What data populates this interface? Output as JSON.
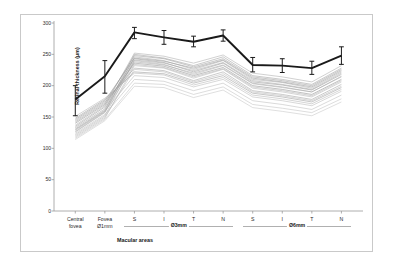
{
  "chart_data": {
    "type": "line",
    "title": "",
    "xlabel": "Macular areas",
    "ylabel": "Retinal thickness (µm)",
    "ylim": [
      0,
      300
    ],
    "yticks": [
      0,
      50,
      100,
      150,
      200,
      250,
      300
    ],
    "grid": false,
    "legend_position": "none",
    "categories": [
      "Central fovea",
      "Fovea Ø1mm",
      "S",
      "I",
      "T",
      "N",
      "S",
      "I",
      "T",
      "N"
    ],
    "category_lines": [
      [
        "Central",
        "fovea"
      ],
      [
        "Fovea",
        "Ø1mm"
      ],
      [
        "S",
        ""
      ],
      [
        "I",
        ""
      ],
      [
        "T",
        ""
      ],
      [
        "N",
        ""
      ],
      [
        "S",
        ""
      ],
      [
        "I",
        ""
      ],
      [
        "T",
        ""
      ],
      [
        "N",
        ""
      ]
    ],
    "groups": [
      {
        "label": "Ø3mm",
        "from_index": 2,
        "to_index": 5
      },
      {
        "label": "Ø6mm",
        "from_index": 6,
        "to_index": 9
      }
    ],
    "series": [
      {
        "name": "Mean retinal thickness",
        "style": "bold-black-with-error-bars",
        "color": "#1a1a1a",
        "values": [
          178,
          215,
          285,
          277,
          270,
          280,
          233,
          232,
          228,
          248
        ],
        "error_low": [
          152,
          188,
          275,
          266,
          262,
          271,
          222,
          221,
          218,
          234
        ],
        "error_high": [
          200,
          240,
          293,
          288,
          279,
          289,
          245,
          243,
          239,
          262
        ]
      },
      {
        "name": "individual-1",
        "style": "thin-grey",
        "color": "#b4b4b4",
        "values": [
          118,
          148,
          232,
          228,
          212,
          226,
          196,
          190,
          182,
          206
        ]
      },
      {
        "name": "individual-2",
        "style": "thin-grey",
        "color": "#b0b0b0",
        "values": [
          122,
          152,
          240,
          234,
          218,
          232,
          203,
          197,
          190,
          214
        ]
      },
      {
        "name": "individual-3",
        "style": "thin-grey",
        "color": "#a8a8a8",
        "values": [
          126,
          157,
          246,
          240,
          226,
          240,
          210,
          205,
          196,
          222
        ]
      },
      {
        "name": "individual-4",
        "style": "thin-grey",
        "color": "#9e9e9e",
        "values": [
          131,
          161,
          250,
          244,
          232,
          246,
          216,
          210,
          202,
          228
        ]
      },
      {
        "name": "individual-5",
        "style": "thin-grey",
        "color": "#969696",
        "values": [
          135,
          166,
          243,
          237,
          222,
          236,
          206,
          201,
          193,
          218
        ]
      },
      {
        "name": "individual-6",
        "style": "thin-grey",
        "color": "#8e8e8e",
        "values": [
          140,
          170,
          236,
          231,
          216,
          229,
          200,
          194,
          186,
          210
        ]
      },
      {
        "name": "individual-7",
        "style": "thin-grey",
        "color": "#a0a0a0",
        "values": [
          144,
          174,
          228,
          224,
          208,
          222,
          192,
          186,
          178,
          202
        ]
      },
      {
        "name": "individual-8",
        "style": "thin-grey",
        "color": "#989898",
        "values": [
          148,
          178,
          222,
          219,
          204,
          216,
          188,
          182,
          174,
          197
        ]
      },
      {
        "name": "individual-9",
        "style": "thin-grey",
        "color": "#b8b8b8",
        "values": [
          130,
          160,
          216,
          213,
          198,
          210,
          182,
          176,
          168,
          191
        ]
      },
      {
        "name": "individual-10",
        "style": "thin-grey",
        "color": "#bcbcbc",
        "values": [
          124,
          154,
          210,
          207,
          192,
          204,
          176,
          170,
          162,
          185
        ]
      },
      {
        "name": "individual-11",
        "style": "thin-grey",
        "color": "#aaaaaa",
        "values": [
          137,
          168,
          252,
          247,
          236,
          249,
          220,
          214,
          206,
          232
        ]
      },
      {
        "name": "individual-12",
        "style": "thin-grey",
        "color": "#9a9a9a",
        "values": [
          142,
          172,
          248,
          243,
          230,
          243,
          214,
          208,
          200,
          226
        ]
      },
      {
        "name": "individual-13",
        "style": "thin-grey",
        "color": "#c0c0c0",
        "values": [
          116,
          146,
          204,
          202,
          186,
          198,
          170,
          164,
          157,
          179
        ]
      },
      {
        "name": "individual-14",
        "style": "thin-grey",
        "color": "#b6b6b6",
        "values": [
          120,
          150,
          226,
          222,
          206,
          219,
          190,
          184,
          176,
          199
        ]
      },
      {
        "name": "individual-15",
        "style": "thin-grey",
        "color": "#a4a4a4",
        "values": [
          133,
          163,
          238,
          233,
          220,
          233,
          204,
          198,
          190,
          215
        ]
      },
      {
        "name": "individual-16",
        "style": "thin-grey",
        "color": "#acacac",
        "values": [
          127,
          158,
          234,
          229,
          214,
          227,
          198,
          192,
          184,
          208
        ]
      },
      {
        "name": "individual-17",
        "style": "thin-grey",
        "color": "#929292",
        "values": [
          146,
          176,
          244,
          239,
          228,
          241,
          212,
          206,
          198,
          224
        ]
      },
      {
        "name": "individual-18",
        "style": "thin-grey",
        "color": "#c4c4c4",
        "values": [
          114,
          144,
          199,
          197,
          181,
          193,
          165,
          159,
          152,
          174
        ]
      },
      {
        "name": "individual-19",
        "style": "thin-grey",
        "color": "#b2b2b2",
        "values": [
          151,
          180,
          220,
          217,
          201,
          213,
          185,
          179,
          171,
          194
        ]
      },
      {
        "name": "individual-20",
        "style": "thin-grey",
        "color": "#a6a6a6",
        "values": [
          129,
          159,
          241,
          236,
          224,
          237,
          208,
          202,
          194,
          220
        ]
      }
    ]
  },
  "axis": {
    "ylabel": "Retinal thickness (µm)",
    "xlabel": "Macular areas"
  }
}
